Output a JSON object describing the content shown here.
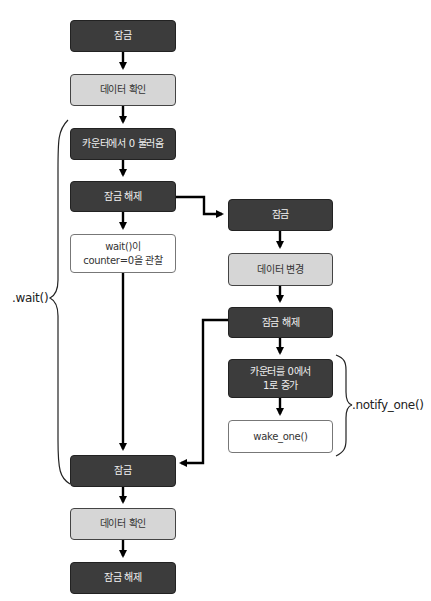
{
  "diagram": {
    "left_column": [
      {
        "id": "l1",
        "label": "잠금",
        "style": "dark"
      },
      {
        "id": "l2",
        "label": "데이터 확인",
        "style": "light"
      },
      {
        "id": "l3",
        "label": "카운터에서 0 불러옴",
        "style": "dark"
      },
      {
        "id": "l4",
        "label": "잠금 해제",
        "style": "dark"
      },
      {
        "id": "l5",
        "label_line1": "wait()이",
        "label_line2": "counter=0을 관찰",
        "style": "white"
      },
      {
        "id": "l6",
        "label": "잠금",
        "style": "dark"
      },
      {
        "id": "l7",
        "label": "데이터 확인",
        "style": "light"
      },
      {
        "id": "l8",
        "label": "잠금 해제",
        "style": "dark"
      }
    ],
    "right_column": [
      {
        "id": "r1",
        "label": "잠금",
        "style": "dark"
      },
      {
        "id": "r2",
        "label": "데이터 변경",
        "style": "light"
      },
      {
        "id": "r3",
        "label": "잠금 해제",
        "style": "dark"
      },
      {
        "id": "r4",
        "label_line1": "카운터를 0에서",
        "label_line2": "1로 증가",
        "style": "dark"
      },
      {
        "id": "r5",
        "label": "wake_one()",
        "style": "white"
      }
    ],
    "braces": {
      "wait_label": ".wait()",
      "notify_label": ".notify_one()"
    },
    "colors": {
      "dark_box": "#3c3c3c",
      "light_box": "#d6d6d6",
      "white_box": "#ffffff",
      "arrow": "#000000"
    }
  }
}
